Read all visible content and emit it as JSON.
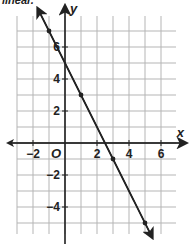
{
  "caption": "linear.",
  "chart_data": {
    "type": "line",
    "title": "",
    "xlabel": "x",
    "ylabel": "y",
    "origin_label": "O",
    "xlim": [
      -2.5,
      7
    ],
    "ylim": [
      -6.5,
      8
    ],
    "grid": true,
    "x_ticks": [
      -2,
      2,
      4,
      6
    ],
    "y_ticks": [
      6,
      4,
      2,
      -2,
      -4
    ],
    "series": [
      {
        "name": "line",
        "equation": "y = -2x + 5",
        "points": [
          [
            -1,
            7
          ],
          [
            1,
            3
          ],
          [
            3,
            -1
          ],
          [
            5,
            -5
          ]
        ],
        "arrows_both_ends": true
      }
    ]
  }
}
